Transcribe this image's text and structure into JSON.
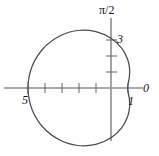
{
  "figure": {
    "kind": "polar-plot",
    "background_color": "#ffffff",
    "curve_color": "#4a4a52",
    "axis_color": "#8c8c8c",
    "text_color": "#111111"
  },
  "labels": {
    "polar_axis": "0",
    "vertical_axis": "π/2",
    "r_at_zero": "1",
    "r_at_half_pi": "3",
    "r_at_pi": "5"
  },
  "chart_data": {
    "type": "line",
    "title": "",
    "subtitle": "",
    "coordinate_system": "polar",
    "xlabel": "0",
    "ylabel": "π/2",
    "grid": false,
    "legend": null,
    "annotations": [
      {
        "text": "0",
        "meaning": "polar axis direction theta = 0",
        "x": 150,
        "y": 88
      },
      {
        "text": "π/2",
        "meaning": "direction theta = pi/2",
        "x": 111,
        "y": 10
      },
      {
        "text": "1",
        "meaning": "curve intercept on polar axis at r = 1",
        "x": 131,
        "y": 101
      },
      {
        "text": "3",
        "meaning": "curve intercept on vertical axis at r = 3",
        "x": 121,
        "y": 39
      },
      {
        "text": "5",
        "meaning": "curve intercept on negative polar axis at r = 5",
        "x": 26,
        "y": 100
      }
    ],
    "axes": {
      "horizontal": {
        "label": "0",
        "from_x": 4,
        "to_x": 143,
        "y": 88,
        "ticks": [
          {
            "x": 28,
            "value": 5
          },
          {
            "x": 45,
            "value": 4
          },
          {
            "x": 62,
            "value": 3
          },
          {
            "x": 79,
            "value": 2
          },
          {
            "x": 96,
            "value": 1
          },
          {
            "x": 128,
            "value": 1
          }
        ],
        "tick_labels": [
          "5",
          "1"
        ]
      },
      "vertical": {
        "label": "π/2",
        "x": 111,
        "from_y": 18,
        "to_y": 141,
        "ticks": [
          {
            "y": 40,
            "value": 3
          },
          {
            "y": 56,
            "value": 2
          },
          {
            "y": 72,
            "value": 1
          }
        ],
        "tick_labels": [
          "3"
        ]
      }
    },
    "curve": {
      "name": "limacon",
      "equation": "r = 3 - 2 cos(theta)",
      "closed": true,
      "r_at_theta_0": 1,
      "r_at_theta_half_pi": 3,
      "r_at_theta_pi": 5,
      "r_at_theta_three_half_pi": 3,
      "pixels_per_unit": 16.6,
      "center_x": 111,
      "center_y": 88,
      "points_polar_deg": [
        {
          "theta": 0,
          "r": 1.0
        },
        {
          "theta": 15,
          "r": 1.07
        },
        {
          "theta": 30,
          "r": 1.27
        },
        {
          "theta": 45,
          "r": 1.59
        },
        {
          "theta": 60,
          "r": 2.0
        },
        {
          "theta": 75,
          "r": 2.48
        },
        {
          "theta": 90,
          "r": 3.0
        },
        {
          "theta": 105,
          "r": 3.52
        },
        {
          "theta": 120,
          "r": 4.0
        },
        {
          "theta": 135,
          "r": 4.41
        },
        {
          "theta": 150,
          "r": 4.73
        },
        {
          "theta": 165,
          "r": 4.93
        },
        {
          "theta": 180,
          "r": 5.0
        },
        {
          "theta": 195,
          "r": 4.93
        },
        {
          "theta": 210,
          "r": 4.73
        },
        {
          "theta": 225,
          "r": 4.41
        },
        {
          "theta": 240,
          "r": 4.0
        },
        {
          "theta": 255,
          "r": 3.52
        },
        {
          "theta": 270,
          "r": 3.0
        },
        {
          "theta": 285,
          "r": 2.48
        },
        {
          "theta": 300,
          "r": 2.0
        },
        {
          "theta": 315,
          "r": 1.59
        },
        {
          "theta": 330,
          "r": 1.27
        },
        {
          "theta": 345,
          "r": 1.07
        },
        {
          "theta": 360,
          "r": 1.0
        }
      ]
    }
  }
}
